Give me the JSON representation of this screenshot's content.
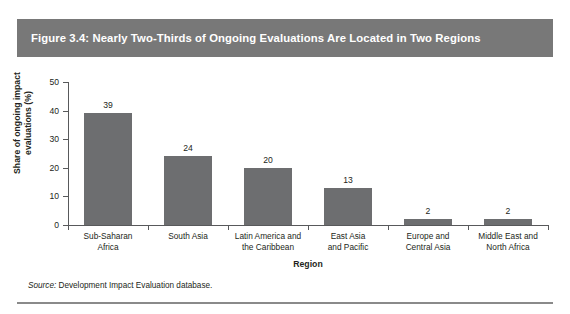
{
  "figure": {
    "title": "Figure 3.4: Nearly Two-Thirds of Ongoing Evaluations Are Located in Two Regions",
    "source_label": "Source:",
    "source_text": " Development Impact Evaluation database.",
    "band_color": "#787878",
    "bar_color": "#6d6e70",
    "axis_color": "#58595b"
  },
  "chart_data": {
    "type": "bar",
    "title": "Figure 3.4: Nearly Two-Thirds of Ongoing Evaluations Are Located in Two Regions",
    "xlabel": "Region",
    "ylabel": "Share of ongoing impact evaluations (%)",
    "ylabel_line1": "Share of ongoing impact",
    "ylabel_line2": "evaluations (%)",
    "categories": [
      "Sub-Saharan Africa",
      "South Asia",
      "Latin America and the Caribbean",
      "East Asia and Pacific",
      "Europe and Central Asia",
      "Middle East and North Africa"
    ],
    "category_lines": [
      [
        "Sub-Saharan",
        "Africa"
      ],
      [
        "South Asia",
        ""
      ],
      [
        "Latin America and",
        "the Caribbean"
      ],
      [
        "East Asia",
        "and Pacific"
      ],
      [
        "Europe and",
        "Central Asia"
      ],
      [
        "Middle East and",
        "North Africa"
      ]
    ],
    "values": [
      39,
      24,
      20,
      13,
      2,
      2
    ],
    "value_labels": [
      "39",
      "24",
      "20",
      "13",
      "2",
      "2"
    ],
    "ylim": [
      0,
      50
    ],
    "yticks": [
      0,
      10,
      20,
      30,
      40,
      50
    ],
    "ytick_labels": [
      "0",
      "10",
      "20",
      "30",
      "40",
      "50"
    ],
    "grid": false,
    "legend": false
  }
}
